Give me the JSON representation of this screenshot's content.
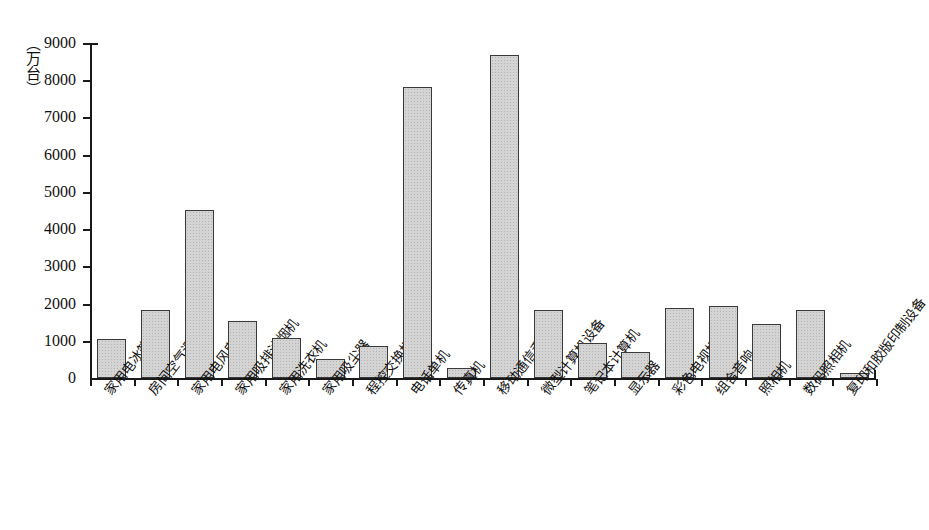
{
  "chart_data": {
    "type": "bar",
    "title": "",
    "subtitle": "",
    "xlabel": "",
    "ylabel": "（万台）",
    "ylim": [
      0,
      9000
    ],
    "ytick_values": [
      0,
      1000,
      2000,
      3000,
      4000,
      5000,
      6000,
      7000,
      8000,
      9000
    ],
    "ytick_labels": [
      "0",
      "1000",
      "2000",
      "3000",
      "4000",
      "5000",
      "6000",
      "7000",
      "8000",
      "9000"
    ],
    "grid": false,
    "legend": "none",
    "bar_color": "#d4d4d4",
    "bar_edge_color": "#3a3a3a",
    "axis_color": "#1a1a1a",
    "categories": [
      "家用电冰箱",
      "房间空气调节器",
      "家用电风扇",
      "家用吸排油烟机",
      "家用洗衣机",
      "家用吸尘器",
      "程控交换机",
      "电话单机",
      "传真机",
      "移动通信手持机",
      "微型计算机设备",
      "笔记本计算机",
      "显示器",
      "彩色电视机",
      "组合音响",
      "照相机",
      "数码照相机",
      "复印和胶版印制设备"
    ],
    "values": [
      1050,
      1820,
      4520,
      1540,
      1080,
      500,
      870,
      7830,
      260,
      8680,
      1840,
      930,
      690,
      1890,
      1930,
      1460,
      1830,
      130
    ]
  }
}
